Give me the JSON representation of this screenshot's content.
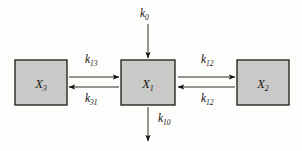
{
  "figure": {
    "type": "compartmental-model-diagram",
    "background_color": "#fdfdfc",
    "box_fill_color": "#c9c9c7",
    "box_border_color": "#2b2723",
    "ink_color": "#15120f"
  },
  "compartments": [
    {
      "id": "x3",
      "symbol": "X",
      "subscript": "3",
      "position": "left",
      "x": 15,
      "y": 60,
      "width": 52,
      "height": 45
    },
    {
      "id": "x1",
      "symbol": "X",
      "subscript": "1",
      "position": "center",
      "x": 121,
      "y": 60,
      "width": 54,
      "height": 45
    },
    {
      "id": "x2",
      "symbol": "X",
      "subscript": "2",
      "position": "right",
      "x": 237,
      "y": 60,
      "width": 52,
      "height": 45
    }
  ],
  "flows": [
    {
      "id": "k0",
      "symbol": "k",
      "subscript": "0",
      "from": "environment",
      "to": "x1",
      "direction": "down",
      "role": "input",
      "label_x": 140,
      "label_y": 17,
      "line_x1": 148,
      "line_y1": 24,
      "line_x2": 148,
      "line_y2": 58
    },
    {
      "id": "k13",
      "symbol": "k",
      "subscript": "13",
      "from": "x3",
      "to": "x1",
      "direction": "right",
      "role": "transfer",
      "label_x": 85,
      "label_y": 63,
      "line_x1": 69,
      "line_y1": 77,
      "line_x2": 119,
      "line_y2": 77
    },
    {
      "id": "k31",
      "symbol": "k",
      "subscript": "31",
      "from": "x1",
      "to": "x3",
      "direction": "left",
      "role": "transfer",
      "label_x": 85,
      "label_y": 102,
      "line_x1": 119,
      "line_y1": 87,
      "line_x2": 69,
      "line_y2": 87
    },
    {
      "id": "k12-forward",
      "symbol": "k",
      "subscript": "12",
      "from": "x1",
      "to": "x2",
      "direction": "right",
      "role": "transfer",
      "label_x": 201,
      "label_y": 63,
      "line_x1": 178,
      "line_y1": 77,
      "line_x2": 235,
      "line_y2": 77
    },
    {
      "id": "k12-backward",
      "symbol": "k",
      "subscript": "12",
      "from": "x2",
      "to": "x1",
      "direction": "left",
      "role": "transfer",
      "label_x": 201,
      "label_y": 102,
      "line_x1": 235,
      "line_y1": 87,
      "line_x2": 178,
      "line_y2": 87
    },
    {
      "id": "k10",
      "symbol": "k",
      "subscript": "10",
      "from": "x1",
      "to": "environment",
      "direction": "down",
      "role": "elimination",
      "label_x": 158,
      "label_y": 122,
      "line_x1": 148,
      "line_y1": 107,
      "line_x2": 148,
      "line_y2": 141
    }
  ]
}
